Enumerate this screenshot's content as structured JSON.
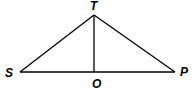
{
  "diagram": {
    "type": "geometry-triangle",
    "stroke_color": "#000000",
    "points": {
      "T": {
        "label": "T",
        "x": 94,
        "y": 15
      },
      "S": {
        "label": "S",
        "x": 20,
        "y": 72
      },
      "P": {
        "label": "P",
        "x": 175,
        "y": 72
      },
      "O": {
        "label": "O",
        "x": 94,
        "y": 72
      }
    },
    "segments": [
      {
        "from": "S",
        "to": "T"
      },
      {
        "from": "T",
        "to": "P"
      },
      {
        "from": "S",
        "to": "P"
      },
      {
        "from": "T",
        "to": "O"
      }
    ],
    "labels": {
      "T": "T",
      "S": "S",
      "P": "P",
      "O": "O"
    }
  }
}
